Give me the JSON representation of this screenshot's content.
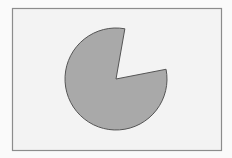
{
  "colors": {
    "page_background": "#fafafa",
    "frame_fill": "#f3f3f3",
    "frame_stroke": "#8c8c8c",
    "pie_fill": "#a9a9a9",
    "pie_stroke": "#555555"
  },
  "frame": {
    "x": 12,
    "y": 8,
    "width": 209,
    "height": 142
  },
  "pie": {
    "cx": 116,
    "cy": 79,
    "r": 51,
    "missing_wedge_start_deg": 11,
    "missing_wedge_end_deg": 80,
    "visible_fraction_pct": 81
  }
}
